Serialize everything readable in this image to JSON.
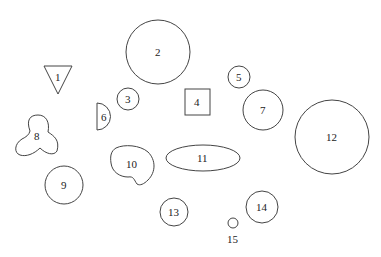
{
  "colors": {
    "stroke": "#444444",
    "text": "#222222",
    "background": "#ffffff"
  },
  "shapes": [
    {
      "id": "1",
      "label": "1",
      "type": "triangle-down",
      "cx": 58,
      "cy": 77
    },
    {
      "id": "2",
      "label": "2",
      "type": "circle",
      "cx": 158,
      "cy": 52,
      "r": 32
    },
    {
      "id": "3",
      "label": "3",
      "type": "circle",
      "cx": 128,
      "cy": 99,
      "r": 11
    },
    {
      "id": "4",
      "label": "4",
      "type": "square",
      "cx": 197,
      "cy": 102
    },
    {
      "id": "5",
      "label": "5",
      "type": "circle",
      "cx": 239,
      "cy": 77,
      "r": 11
    },
    {
      "id": "6",
      "label": "6",
      "type": "half-circle",
      "cx": 104,
      "cy": 117
    },
    {
      "id": "7",
      "label": "7",
      "type": "circle",
      "cx": 263,
      "cy": 110,
      "r": 20
    },
    {
      "id": "8",
      "label": "8",
      "type": "trefoil-blob",
      "cx": 38,
      "cy": 137
    },
    {
      "id": "9",
      "label": "9",
      "type": "circle",
      "cx": 64,
      "cy": 185,
      "r": 19
    },
    {
      "id": "10",
      "label": "10",
      "type": "kidney-blob",
      "cx": 133,
      "cy": 165
    },
    {
      "id": "11",
      "label": "11",
      "type": "ellipse",
      "cx": 203,
      "cy": 158,
      "rx": 37,
      "ry": 13
    },
    {
      "id": "12",
      "label": "12",
      "type": "circle",
      "cx": 332,
      "cy": 137,
      "r": 37
    },
    {
      "id": "13",
      "label": "13",
      "type": "circle",
      "cx": 174,
      "cy": 212,
      "r": 14
    },
    {
      "id": "14",
      "label": "14",
      "type": "circle",
      "cx": 262,
      "cy": 207,
      "r": 16
    },
    {
      "id": "15",
      "label": "15",
      "type": "circle",
      "cx": 233,
      "cy": 223,
      "r": 5
    }
  ]
}
